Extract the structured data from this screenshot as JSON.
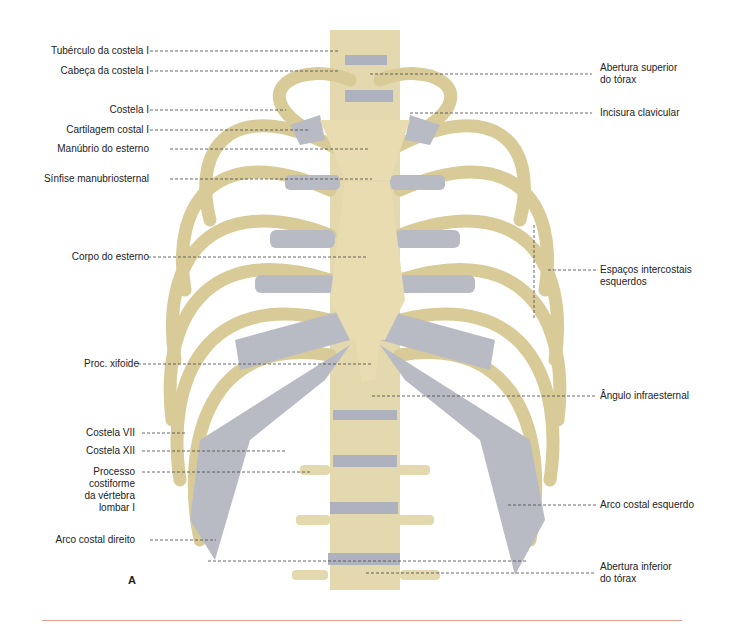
{
  "figure": {
    "panel_label": "A",
    "colors": {
      "bone": "#e6dcb0",
      "bone_shadow": "#b9ab78",
      "cartilage": "#b8bac2",
      "disc": "#aeb2bf",
      "leader": "#444444",
      "rule": "#e8a090"
    }
  },
  "labels_left": [
    {
      "text": "Tubérculo da costela I"
    },
    {
      "text": "Cabeça da costela I"
    },
    {
      "text": "Costela I"
    },
    {
      "text": "Cartilagem costal I"
    },
    {
      "text": "Manúbrio do esterno"
    },
    {
      "text": "Sínfise manubriosternal"
    },
    {
      "text": "Corpo do esterno"
    },
    {
      "text": "Proc. xifoide"
    },
    {
      "text": "Costela VII"
    },
    {
      "text": "Costela XII"
    },
    {
      "text": "Processo\ncostiforme\nda vértebra\nlombar I"
    },
    {
      "text": "Arco costal direito"
    }
  ],
  "labels_right": [
    {
      "text": "Abertura superior\ndo tórax"
    },
    {
      "text": "Incisura clavicular"
    },
    {
      "text": "Espaços intercostais\nesquerdos"
    },
    {
      "text": "Ângulo infraesternal"
    },
    {
      "text": "Arco costal esquerdo"
    },
    {
      "text": "Abertura inferior\ndo tórax"
    }
  ]
}
